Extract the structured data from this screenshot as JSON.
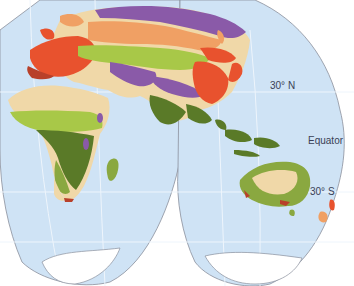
{
  "map": {
    "type": "biome-world-map",
    "projection": "interrupted (Goode-like), eastern hemisphere lobes",
    "labels": {
      "lat_30n": "30° N",
      "equator": "Equator",
      "lat_30s": "30° S"
    },
    "colors": {
      "ocean": "#cfe3f5",
      "graticule": "#eef5fc",
      "outline": "#8a8f9c",
      "ice": "#ffffff",
      "tundra": "#8a5aa8",
      "boreal_forest": "#f0a064",
      "temperate_forest": "#e8522e",
      "mediterranean": "#b8402a",
      "grassland": "#a8c848",
      "desert": "#f0d8a8",
      "savanna": "#8aa840",
      "tropical_forest": "#5a7a28",
      "mountains": "#8a5aa8"
    },
    "regions": [
      "Europe",
      "Asia",
      "Africa",
      "Australia",
      "New Zealand",
      "Antarctica",
      "Southeast Asia",
      "Madagascar"
    ]
  }
}
